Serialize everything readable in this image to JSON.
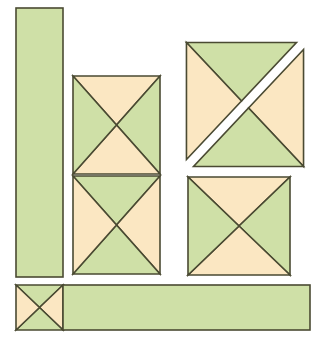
{
  "figure": {
    "type": "geometric-diagram",
    "canvas": {
      "width": 319,
      "height": 345,
      "background": "#ffffff"
    }
  },
  "palette": {
    "green": "#cfe0a7",
    "cream": "#fbe7c2",
    "outline": "#4a4a32",
    "background": "#ffffff",
    "outline_width": "1.6"
  },
  "shapes": [
    {
      "name": "vertical-bar",
      "label": "Vertical green bar",
      "kind": "rectangle",
      "fill": "green",
      "x": 16,
      "y": 8,
      "width": 47,
      "height": 269
    },
    {
      "name": "square-middle-upper",
      "label": "Middle upper quartered square",
      "kind": "quartered-square",
      "x": 73,
      "y": 76,
      "width": 87,
      "height": 98,
      "top": "cream",
      "right": "green",
      "bottom": "cream",
      "left": "green"
    },
    {
      "name": "square-middle-lower",
      "label": "Middle lower quartered square",
      "kind": "quartered-square",
      "x": 73,
      "y": 176,
      "width": 87,
      "height": 98,
      "top": "green",
      "right": "cream",
      "bottom": "green",
      "left": "cream"
    },
    {
      "name": "square-top-right-split",
      "label": "Top right square split along anti-diagonal",
      "kind": "split-square",
      "x": 190,
      "y": 46,
      "width": 110,
      "height": 117,
      "upper_left_half": {
        "top": "green",
        "left": "cream"
      },
      "lower_right_half": {
        "right": "cream",
        "bottom": "green"
      },
      "gap": 10
    },
    {
      "name": "square-bottom-right",
      "label": "Bottom right quartered square",
      "kind": "quartered-square",
      "x": 188,
      "y": 177,
      "width": 102,
      "height": 98,
      "top": "cream",
      "right": "green",
      "bottom": "cream",
      "left": "green"
    },
    {
      "name": "square-small-bottom-left",
      "label": "Small quartered square bottom left",
      "kind": "quartered-square",
      "x": 16,
      "y": 285,
      "width": 47,
      "height": 45,
      "top": "green",
      "right": "cream",
      "bottom": "green",
      "left": "cream"
    },
    {
      "name": "horizontal-bar",
      "label": "Horizontal green bar",
      "kind": "rectangle",
      "fill": "green",
      "x": 63,
      "y": 285,
      "width": 247,
      "height": 45
    }
  ]
}
